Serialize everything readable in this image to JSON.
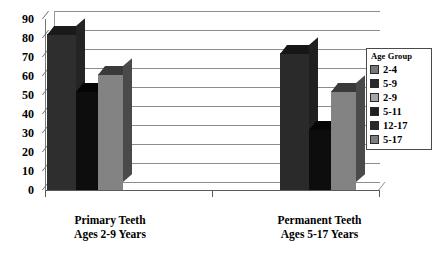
{
  "chart_data": {
    "type": "bar",
    "title": "",
    "xlabel": "",
    "ylabel": "",
    "ylim": [
      0,
      90
    ],
    "ytick_step": 10,
    "yticks": [
      "90",
      "80",
      "70",
      "60",
      "50",
      "40",
      "30",
      "20",
      "10",
      "0"
    ],
    "grid": true,
    "legend_position": "right",
    "legend_title": "Age Group",
    "categories": [
      "Primary Teeth\nAges 2-9 Years",
      "Permanent Teeth\nAges 5-17 Years"
    ],
    "groups": [
      {
        "label_line1": "Primary Teeth",
        "label_line2": "Ages 2-9 Years",
        "bars": [
          {
            "series": "2-4",
            "value": 82,
            "color": "#2f2f2f"
          },
          {
            "series": "5-9",
            "value": 52,
            "color": "#111111"
          },
          {
            "series": "2-9",
            "value": 61,
            "color": "#777777"
          }
        ]
      },
      {
        "label_line1": "Permanent Teeth",
        "label_line2": "Ages 5-17 Years",
        "bars": [
          {
            "series": "5-11",
            "value": 72,
            "color": "#2f2f2f"
          },
          {
            "series": "12-17",
            "value": 32,
            "color": "#111111"
          },
          {
            "series": "5-17",
            "value": 52,
            "color": "#777777"
          }
        ]
      }
    ],
    "series": [
      {
        "name": "2-4",
        "values": [
          82,
          null
        ],
        "color": "#777777"
      },
      {
        "name": "5-9",
        "values": [
          52,
          null
        ],
        "color": "#2a2a2a"
      },
      {
        "name": "2-9",
        "values": [
          61,
          null
        ],
        "color": "#9a9a9a"
      },
      {
        "name": "5-11",
        "values": [
          null,
          72
        ],
        "color": "#1f1f1f"
      },
      {
        "name": "12-17",
        "values": [
          null,
          32
        ],
        "color": "#2a2a2a"
      },
      {
        "name": "5-17",
        "values": [
          null,
          52
        ],
        "color": "#777777"
      }
    ]
  },
  "legend": {
    "title": "Age Group",
    "items": [
      {
        "label": "2-4",
        "color": "#777777"
      },
      {
        "label": "5-9",
        "color": "#2a2a2a"
      },
      {
        "label": "2-9",
        "color": "#9e9e9e"
      },
      {
        "label": "5-11",
        "color": "#1f1f1f"
      },
      {
        "label": "12-17",
        "color": "#2a2a2a"
      },
      {
        "label": "5-17",
        "color": "#777777"
      }
    ]
  }
}
